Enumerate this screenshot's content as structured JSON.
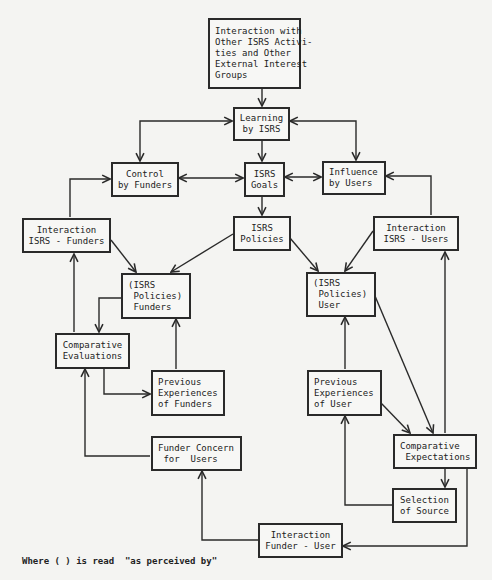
{
  "diagram": {
    "nodes": {
      "external": {
        "lines": [
          "Interaction with",
          "Other ISRS Activi-",
          "ties and Other",
          "External Interest",
          "Groups"
        ]
      },
      "learning": {
        "lines": [
          "Learning",
          "by ISRS"
        ]
      },
      "control": {
        "lines": [
          "Control",
          "by Funders"
        ]
      },
      "goals": {
        "lines": [
          "ISRS",
          "Goals"
        ]
      },
      "influence": {
        "lines": [
          "Influence",
          "by Users"
        ]
      },
      "interaction_funders": {
        "lines": [
          "Interaction",
          "ISRS - Funders"
        ]
      },
      "policies": {
        "lines": [
          "ISRS",
          "Policies"
        ]
      },
      "interaction_users": {
        "lines": [
          "Interaction",
          "ISRS - Users"
        ]
      },
      "policies_funders": {
        "lines": [
          "(ISRS",
          " Policies)",
          " Funders"
        ]
      },
      "policies_user": {
        "lines": [
          "(ISRS",
          " Policies)",
          " User"
        ]
      },
      "comparative_evaluations": {
        "lines": [
          "Comparative",
          "Evaluations"
        ]
      },
      "prev_funders": {
        "lines": [
          "Previous",
          "Experiences",
          "of Funders"
        ]
      },
      "prev_user": {
        "lines": [
          "Previous",
          "Experiences",
          "of User"
        ]
      },
      "comparative_expectations": {
        "lines": [
          "Comparative",
          " Expectations"
        ]
      },
      "funder_concern": {
        "lines": [
          "Funder Concern",
          " for  Users"
        ]
      },
      "selection_source": {
        "lines": [
          "Selection",
          "of Source"
        ]
      },
      "interaction_funder_user": {
        "lines": [
          "Interaction",
          "Funder - User"
        ]
      }
    },
    "edges": [
      {
        "from": "external",
        "to": "learning",
        "type": "arrow"
      },
      {
        "from": "learning",
        "to": "control",
        "type": "bidirectional"
      },
      {
        "from": "learning",
        "to": "influence",
        "type": "bidirectional"
      },
      {
        "from": "learning",
        "to": "goals",
        "type": "arrow"
      },
      {
        "from": "control",
        "to": "goals",
        "type": "bidirectional"
      },
      {
        "from": "goals",
        "to": "influence",
        "type": "bidirectional"
      },
      {
        "from": "goals",
        "to": "policies",
        "type": "arrow"
      },
      {
        "from": "interaction_funders",
        "to": "control",
        "type": "arrow"
      },
      {
        "from": "interaction_users",
        "to": "influence",
        "type": "arrow"
      },
      {
        "from": "interaction_funders",
        "to": "policies_funders",
        "type": "arrow"
      },
      {
        "from": "policies",
        "to": "policies_funders",
        "type": "arrow"
      },
      {
        "from": "policies",
        "to": "policies_user",
        "type": "arrow"
      },
      {
        "from": "interaction_users",
        "to": "policies_user",
        "type": "arrow"
      },
      {
        "from": "policies_funders",
        "to": "comparative_evaluations",
        "type": "arrow"
      },
      {
        "from": "comparative_evaluations",
        "to": "interaction_funders",
        "type": "arrow"
      },
      {
        "from": "comparative_evaluations",
        "to": "prev_funders",
        "type": "arrow"
      },
      {
        "from": "prev_funders",
        "to": "policies_funders",
        "type": "arrow"
      },
      {
        "from": "funder_concern",
        "to": "comparative_evaluations",
        "type": "arrow"
      },
      {
        "from": "prev_user",
        "to": "policies_user",
        "type": "arrow"
      },
      {
        "from": "policies_user",
        "to": "comparative_expectations",
        "type": "arrow"
      },
      {
        "from": "prev_user",
        "to": "comparative_expectations",
        "type": "arrow"
      },
      {
        "from": "comparative_expectations",
        "to": "interaction_users",
        "type": "arrow"
      },
      {
        "from": "comparative_expectations",
        "to": "selection_source",
        "type": "arrow"
      },
      {
        "from": "selection_source",
        "to": "prev_user",
        "type": "arrow"
      },
      {
        "from": "comparative_expectations",
        "to": "interaction_funder_user",
        "type": "arrow"
      },
      {
        "from": "interaction_funder_user",
        "to": "funder_concern",
        "type": "arrow"
      }
    ],
    "footnote": "Where ( ) is read  \"as perceived by\""
  }
}
